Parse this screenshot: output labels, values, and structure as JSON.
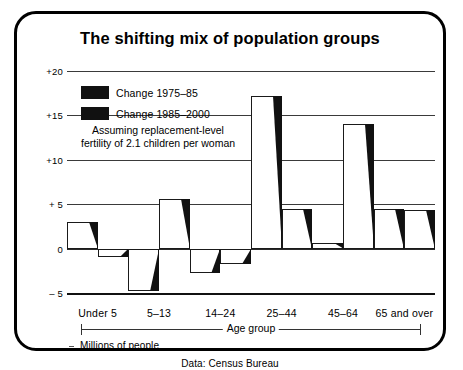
{
  "title": "The shifting mix of population groups",
  "source": "Data: Census Bureau",
  "units_label": "Millions of people",
  "axis_group_label": "Age group",
  "legend": {
    "items": [
      {
        "label": "Change 1975–85",
        "color": "#111111"
      },
      {
        "label": "Change 1985–2000",
        "color": "#111111"
      }
    ],
    "note_line1": "Assuming replacement-level",
    "note_line2": "fertility of 2.1 children per woman"
  },
  "chart_data": {
    "type": "bar",
    "title": "The shifting mix of population groups",
    "subtitle": "Assuming replacement-level fertility of 2.1 children per woman",
    "xlabel": "Age group",
    "ylabel": "Millions of people",
    "ylim": [
      -5,
      20
    ],
    "yticks": [
      -5,
      0,
      5,
      10,
      15,
      20
    ],
    "ytick_labels": [
      "– 5",
      "0",
      "+ 5",
      "+10",
      "+15",
      "+20"
    ],
    "grid": true,
    "legend_position": "upper-left-inside",
    "categories": [
      "Under 5",
      "5–13",
      "14–24",
      "25–44",
      "45–64",
      "65 and over"
    ],
    "series": [
      {
        "name": "Change 1975–85",
        "values": [
          3.0,
          -4.8,
          -2.8,
          17.2,
          0.6,
          4.5
        ]
      },
      {
        "name": "Change 1985–2000",
        "values": [
          -1.0,
          5.6,
          -1.7,
          4.5,
          14.0,
          4.4
        ]
      }
    ]
  }
}
